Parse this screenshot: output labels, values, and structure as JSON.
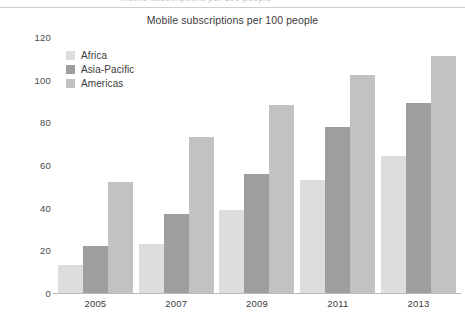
{
  "figure": {
    "clipped_header_text": "Mobile subscriptions per 100 people",
    "title": "Mobile subscriptions per 100 people"
  },
  "legend": {
    "position": "top-left-inside",
    "items": [
      {
        "label": "Africa",
        "color": "#dddddd"
      },
      {
        "label": "Asia-Pacific",
        "color": "#9e9e9e"
      },
      {
        "label": "Americas",
        "color": "#c2c2c2"
      }
    ]
  },
  "axes": {
    "y_ticks": [
      "120",
      "100",
      "80",
      "60",
      "40",
      "20",
      "0"
    ],
    "x_ticks": [
      "2005",
      "2007",
      "2009",
      "2011",
      "2013"
    ]
  },
  "chart_data": {
    "type": "bar",
    "title": "Mobile subscriptions per 100 people",
    "xlabel": "",
    "ylabel": "",
    "ylim": [
      0,
      120
    ],
    "ytick_step": 20,
    "grid": false,
    "legend_position": "upper left",
    "categories": [
      "2005",
      "2007",
      "2009",
      "2011",
      "2013"
    ],
    "series": [
      {
        "name": "Africa",
        "color": "#dddddd",
        "values": [
          13,
          23,
          39,
          53,
          64
        ]
      },
      {
        "name": "Asia-Pacific",
        "color": "#9e9e9e",
        "values": [
          22,
          37,
          56,
          78,
          89
        ]
      },
      {
        "name": "Americas",
        "color": "#c2c2c2",
        "values": [
          52,
          73,
          88,
          102,
          111
        ]
      }
    ]
  },
  "colors": {
    "axis_line": "#b9b9b9",
    "top_rule": "#cfcfcf",
    "text": "#3b3b3b",
    "background": "#ffffff"
  }
}
